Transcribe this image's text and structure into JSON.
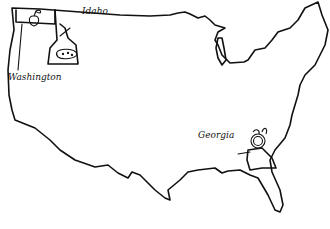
{
  "map": {
    "title": "",
    "region": "Contiguous United States (outline)",
    "stroke_color": "#111111",
    "background": "#ffffff",
    "labels": [
      {
        "id": "washington",
        "text": "Washington",
        "icon": "apple-icon"
      },
      {
        "id": "idaho",
        "text": "Idaho",
        "icon": "potato-icon"
      },
      {
        "id": "georgia",
        "text": "Georgia",
        "icon": "peach-icon"
      }
    ]
  }
}
